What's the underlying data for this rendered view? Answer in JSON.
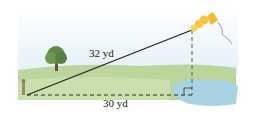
{
  "diagram": {
    "hypotenuse_label": "32 yd",
    "base_label": "30 yd",
    "colors": {
      "sky": "#e6f2f8",
      "grass": "#b9d39a",
      "grass_dark": "#9dc27c",
      "water": "#a9d3e3",
      "tree": "#5e8a46",
      "kite": "#f5c842",
      "line": "#1f1f1f",
      "dashed": "#2b2b2b"
    }
  }
}
